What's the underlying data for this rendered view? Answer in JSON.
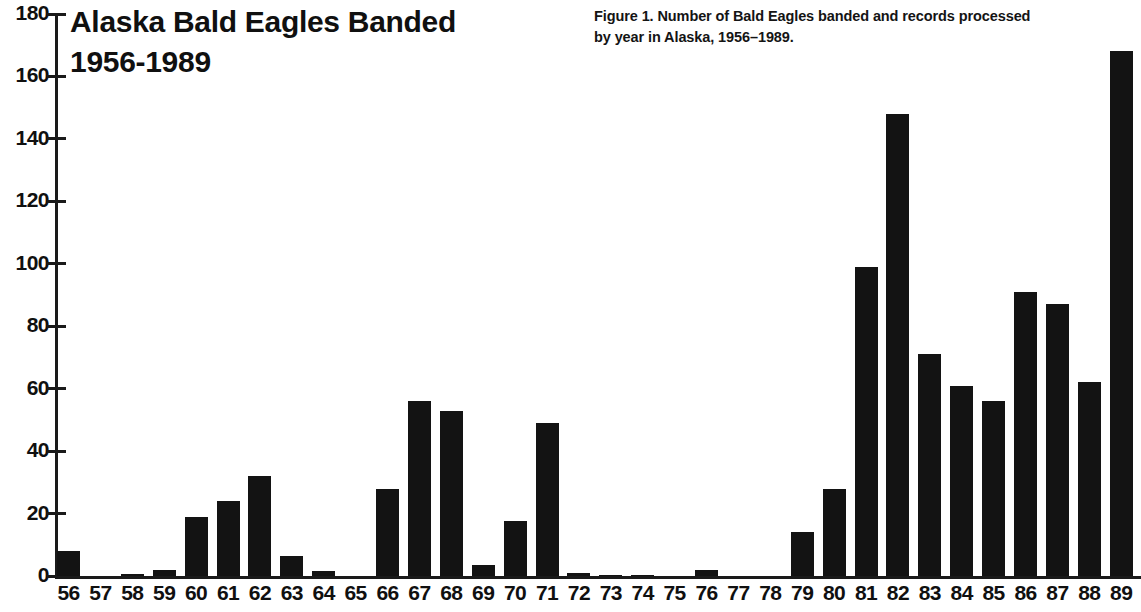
{
  "chart_data": {
    "type": "bar",
    "title": "Alaska Bald Eagles Banded\n1956-1989",
    "caption_line1": "Figure 1. Number of Bald Eagles banded and records processed",
    "caption_line2": "by year in Alaska, 1956–1989.",
    "xlabel": "",
    "ylabel": "",
    "ylim": [
      0,
      180
    ],
    "ytick_step": 20,
    "grid": false,
    "legend": null,
    "bar_color": "#131313",
    "axis_color": "#1a1a1a",
    "categories": [
      "56",
      "57",
      "58",
      "59",
      "60",
      "61",
      "62",
      "63",
      "64",
      "65",
      "66",
      "67",
      "68",
      "69",
      "70",
      "71",
      "72",
      "73",
      "74",
      "75",
      "76",
      "77",
      "78",
      "79",
      "80",
      "81",
      "82",
      "83",
      "84",
      "85",
      "86",
      "87",
      "88",
      "89"
    ],
    "values": [
      8,
      0,
      0.5,
      2,
      19,
      24,
      32,
      6.5,
      1.5,
      0,
      28,
      56,
      53,
      3.5,
      17.5,
      49,
      1,
      0.3,
      0.3,
      0,
      2,
      0,
      0,
      14,
      28,
      99,
      148,
      71,
      61,
      56,
      91,
      87,
      62,
      168
    ],
    "yticks": [
      0,
      20,
      40,
      60,
      80,
      100,
      120,
      140,
      160,
      180
    ]
  }
}
